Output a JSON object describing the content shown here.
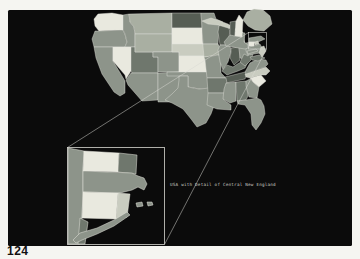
{
  "page": {
    "number": "124",
    "background": "#f5f5f1"
  },
  "figure": {
    "caption": "USA with Detail of Central New England",
    "background": "#0b0b0b",
    "caption_color": "#c9c9c2",
    "line_color": "#d8d8d2"
  },
  "palette": {
    "L0": "#e9e9df",
    "L1": "#c9ccc0",
    "L2": "#a9afa2",
    "L3": "#8d948a",
    "L4": "#6f776d",
    "L5": "#565d54",
    "border": "#e6e6df"
  },
  "map": {
    "states": [
      {
        "id": "wa",
        "shade": "L0",
        "pts": "94,19 98,14 112,13 123,15 123,30 99,31 95,26"
      },
      {
        "id": "or",
        "shade": "L3",
        "pts": "95,31 99,31 123,30 125,34 127,42 125,47 94,47 92,39"
      },
      {
        "id": "id",
        "shade": "L3",
        "pts": "123,15 129,14 130,22 134,27 135,34 135,47 125,47 127,42 125,34 123,30"
      },
      {
        "id": "mt",
        "shade": "L2",
        "pts": "129,14 172,13 172,34 135,34 134,27 130,22"
      },
      {
        "id": "ca",
        "shade": "L3",
        "pts": "94,47 113,47 113,61 125,81 125,93 120,96 114,92 102,74 96,58"
      },
      {
        "id": "nv",
        "shade": "L0",
        "pts": "113,47 131,47 131,71 126,79 125,75 113,61"
      },
      {
        "id": "ut",
        "shade": "L4",
        "pts": "131,47 135,47 135,52 153,52 153,57 158,57 158,73 132,73 131,71"
      },
      {
        "id": "wy",
        "shade": "L2",
        "pts": "135,34 172,34 172,52 135,52"
      },
      {
        "id": "co",
        "shade": "L3",
        "pts": "153,52 179,52 179,72 158,72 158,57 153,57"
      },
      {
        "id": "az",
        "shade": "L3",
        "pts": "132,73 158,73 158,100 142,101 128,85 126,80 131,73"
      },
      {
        "id": "nm",
        "shade": "L3",
        "pts": "158,73 179,72 181,102 158,102"
      },
      {
        "id": "nd",
        "shade": "L5",
        "pts": "172,13 201,13 202,28 172,28"
      },
      {
        "id": "sd",
        "shade": "L0",
        "pts": "172,28 202,28 203,44 172,44"
      },
      {
        "id": "ne",
        "shade": "L1",
        "pts": "172,44 203,44 206,48 208,56 179,56 179,52 172,52"
      },
      {
        "id": "ks",
        "shade": "L0",
        "pts": "179,56 208,56 210,59 210,72 179,72"
      },
      {
        "id": "ok",
        "shade": "L3",
        "pts": "167,72 210,72 211,88 199,89 188,87 188,76 167,76"
      },
      {
        "id": "tx",
        "shade": "L3",
        "pts": "179,76 188,76 188,87 199,89 211,88 212,99 215,103 211,114 206,123 197,127 191,119 183,109 172,103 165,100 172,94 178,88 179,80"
      },
      {
        "id": "mn",
        "shade": "L3",
        "pts": "201,13 214,13 216,19 223,22 219,26 218,44 203,44 202,28"
      },
      {
        "id": "ia",
        "shade": "L2",
        "pts": "203,44 218,44 221,49 219,55 204,57 203,46"
      },
      {
        "id": "mo",
        "shade": "L3",
        "pts": "204,57 219,55 221,60 221,73 226,78 207,78 205,60"
      },
      {
        "id": "wi",
        "shade": "L5",
        "pts": "219,26 223,23 228,27 230,31 229,37 232,42 230,45 220,45 218,32"
      },
      {
        "id": "mi-upper",
        "shade": "L1",
        "pts": "202,21 211,18 220,21 228,24 236,29 240,29 236,31 228,28 218,25 208,24"
      },
      {
        "id": "mi-lower",
        "shade": "L1",
        "pts": "236,31 240,29 243,33 244,39 245,44 246,46 243,47 235,47 234,41 234,35"
      },
      {
        "id": "il",
        "shade": "L3",
        "pts": "220,45 230,45 231,52 228,62 223,70 220,62 218,50"
      },
      {
        "id": "in",
        "shade": "L5",
        "pts": "231,48 239,47 240,60 234,65 230,58 231,52"
      },
      {
        "id": "oh",
        "shade": "L3",
        "pts": "239,47 241,44 251,42 253,46 251,56 245,60 240,58"
      },
      {
        "id": "ky",
        "shade": "L4",
        "pts": "222,71 227,65 233,67 239,63 244,61 248,62 245,68 238,71 227,75"
      },
      {
        "id": "tn",
        "shade": "L5",
        "pts": "225,77 245,72 248,72 245,79 226,83"
      },
      {
        "id": "ar",
        "shade": "L4",
        "pts": "207,78 226,78 227,83 225,93 208,93"
      },
      {
        "id": "la",
        "shade": "L3",
        "pts": "208,93 225,93 224,100 231,105 231,110 217,109 207,105"
      },
      {
        "id": "ms",
        "shade": "L3",
        "pts": "226,83 236,82 236,101 230,103 223,99 224,89"
      },
      {
        "id": "al",
        "shade": "L4",
        "pts": "236,82 246,81 248,96 246,100 237,101"
      },
      {
        "id": "ga",
        "shade": "L3",
        "pts": "246,81 250,79 253,82 259,87 257,98 249,97 246,86"
      },
      {
        "id": "fl",
        "shade": "L3",
        "pts": "237,101 246,100 257,98 261,100 264,106 265,114 261,123 256,130 252,125 251,114 245,105 238,104"
      },
      {
        "id": "sc",
        "shade": "L0",
        "pts": "250,78 261,75 266,81 259,87 253,82"
      },
      {
        "id": "nc",
        "shade": "L1",
        "pts": "245,74 266,67 270,71 266,75 261,75 250,78 246,77"
      },
      {
        "id": "va",
        "shade": "L3",
        "pts": "245,72 250,63 258,59 266,60 268,64 265,67 246,74"
      },
      {
        "id": "wv",
        "shade": "L4",
        "pts": "240,62 244,54 248,56 250,51 253,54 251,60 245,66"
      },
      {
        "id": "md",
        "shade": "L4",
        "pts": "250,57 259,55 265,58 258,61 252,60"
      },
      {
        "id": "pa",
        "shade": "L3",
        "pts": "246,48 260,44 262,48 260,53 248,55 246,51"
      },
      {
        "id": "nj",
        "shade": "L1",
        "pts": "261,47 264,46 266,51 262,57 259,53"
      },
      {
        "id": "ny",
        "shade": "L3",
        "pts": "224,42 230,35 238,32 245,33 244,42 248,45 248,48 245,49 226,46"
      },
      {
        "id": "long-island",
        "shade": "L3",
        "pts": "247,51 256,49 258,51 248,54"
      },
      {
        "id": "vt",
        "shade": "L5",
        "pts": "230,22 236,21 235,36 230,35"
      },
      {
        "id": "nh",
        "shade": "L0",
        "pts": "236,21 239,15 243,20 242,37 235,36"
      },
      {
        "id": "me",
        "shade": "L2",
        "pts": "243,20 247,12 254,9 263,10 270,16 272,24 264,31 255,30 248,26"
      },
      {
        "id": "ma",
        "shade": "L3",
        "pts": "249,38 261,36 265,39 258,42 249,42"
      },
      {
        "id": "ct",
        "shade": "L0",
        "pts": "249,42 255,42 254,46 249,46"
      },
      {
        "id": "ri",
        "shade": "L1",
        "pts": "255,42 258,41 259,44 255,45"
      }
    ]
  },
  "inset": {
    "regions": [
      {
        "id": "new-york-strip",
        "shade": "L3",
        "pts": "68,148 84,151 83,171 83,192 82,218 80,244 68,244"
      },
      {
        "id": "vermont",
        "shade": "L0",
        "pts": "84,151 119,153 118,172 83,171"
      },
      {
        "id": "new-hampshire",
        "shade": "L4",
        "pts": "119,153 137,155 136,174 118,172"
      },
      {
        "id": "massachusetts",
        "shade": "L3",
        "pts": "83,171 132,173 138,176 144,178 147,184 144,190 138,187 132,190 120,193 83,192"
      },
      {
        "id": "connecticut",
        "shade": "L0",
        "pts": "83,192 118,193 116,219 82,218"
      },
      {
        "id": "rhode-island",
        "shade": "L1",
        "pts": "118,193 130,194 127,217 116,219"
      },
      {
        "id": "nyc-corner",
        "shade": "L4",
        "pts": "80,218 88,222 85,244 78,244"
      },
      {
        "id": "long-island",
        "shade": "L3",
        "pts": "73,240 80,233 97,228 114,220 127,212 130,215 114,226 97,234 82,240 76,243"
      },
      {
        "id": "marthas-vineyard",
        "shade": "L3",
        "pts": "136,203 142,202 143,206 137,207"
      },
      {
        "id": "nantucket",
        "shade": "L3",
        "pts": "147,202 152,202 153,205 148,206"
      }
    ]
  }
}
